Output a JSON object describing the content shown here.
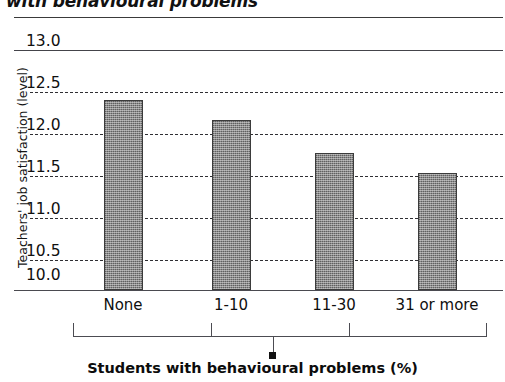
{
  "chart_data": {
    "type": "bar",
    "title": "with behavioural problems",
    "xlabel": "Students with behavioural problems (%)",
    "ylabel": "Teachers' job satisfaction (level)",
    "categories": [
      "None",
      "1-10",
      "11-30",
      "31 or more"
    ],
    "values": [
      12.37,
      12.12,
      11.71,
      11.46
    ],
    "series": [
      {
        "name": "Teachers' job satisfaction (level)",
        "values": [
          12.37,
          12.12,
          11.71,
          11.46
        ]
      }
    ],
    "ylim": [
      10.0,
      13.0
    ],
    "yticks": [
      "13.0",
      "12.5",
      "12.0",
      "11.5",
      "11.0",
      "10.5",
      "10.0"
    ],
    "ytick_values": [
      13.0,
      12.5,
      12.0,
      11.5,
      11.0,
      10.5,
      10.0
    ],
    "grid": "horizontal-dashed",
    "legend": "none",
    "bar_color": "#8a8a8a",
    "bar_edge_color": "#3b3b3b",
    "axis_color": "#4a4a50"
  }
}
